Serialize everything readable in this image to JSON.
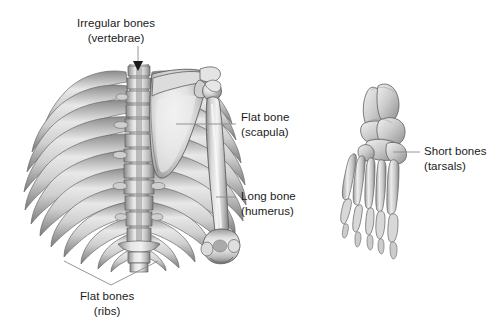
{
  "figure": {
    "background_color": "#ffffff",
    "text_color": "#1b1b1b",
    "leader_color": "#8a8a8a",
    "bone_light": "#f2f2f2",
    "bone_mid": "#bcbcbc",
    "bone_dark": "#6f6f6f",
    "bone_outline": "#5a5a5a"
  },
  "labels": [
    {
      "id": "irregular-bones",
      "line1": "Irregular bones",
      "line2": "(vertebrae)",
      "align": "center",
      "x": 77,
      "y": 16,
      "leader": {
        "type": "arrow-down",
        "x1": 138,
        "y1": 46,
        "x2": 138,
        "y2": 66
      }
    },
    {
      "id": "flat-bone-scapula",
      "line1": "Flat bone",
      "line2": "(scapula)",
      "align": "left",
      "x": 241,
      "y": 110,
      "leader": {
        "type": "line",
        "x1": 176,
        "y1": 124,
        "x2": 236,
        "y2": 124
      }
    },
    {
      "id": "long-bone-humerus",
      "line1": "Long bone",
      "line2": "(humerus)",
      "align": "left",
      "x": 241,
      "y": 189,
      "leader": {
        "type": "line",
        "x1": 216,
        "y1": 197,
        "x2": 236,
        "y2": 197
      }
    },
    {
      "id": "short-bones-tarsals",
      "line1": "Short bones",
      "line2": "(tarsals)",
      "align": "left",
      "x": 424,
      "y": 144,
      "leader": {
        "type": "line",
        "x1": 393,
        "y1": 152,
        "x2": 420,
        "y2": 152
      }
    },
    {
      "id": "flat-bones-ribs",
      "line1": "Flat bones",
      "line2": "(ribs)",
      "align": "center",
      "x": 80,
      "y": 289,
      "leader": {
        "type": "v-converge",
        "left_x": 64,
        "left_y": 261,
        "right_x": 158,
        "right_y": 261,
        "apex_x": 111,
        "apex_y": 285
      }
    }
  ],
  "anatomy": {
    "thorax": {
      "name": "posterior-thoracic-cage",
      "rib_pairs": 12,
      "vertebrae_count": 12,
      "view": "posterior"
    },
    "scapula": {
      "name": "right-scapula",
      "view": "posterior"
    },
    "humerus": {
      "name": "right-humerus",
      "view": "posterior"
    },
    "foot": {
      "name": "foot-skeleton",
      "view": "dorsal",
      "metatarsals": 5,
      "toes": 5
    }
  }
}
